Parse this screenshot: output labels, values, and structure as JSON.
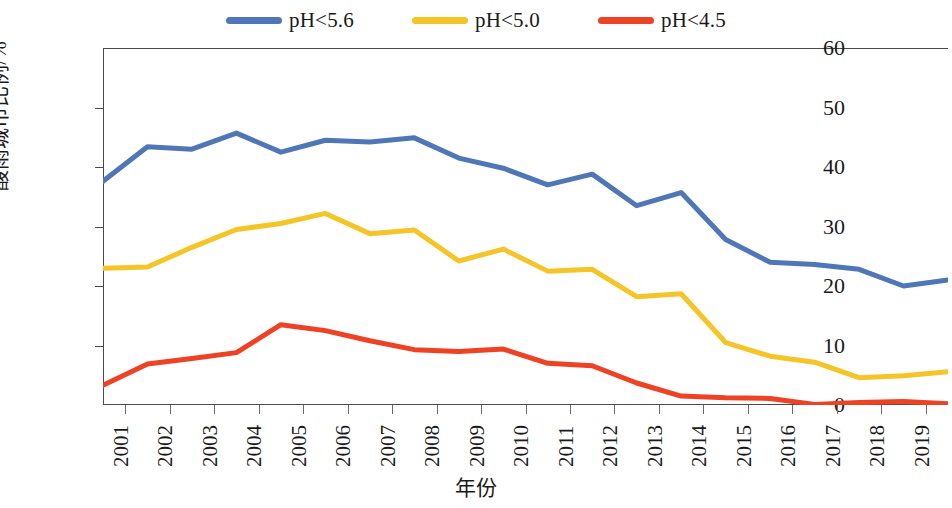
{
  "chart_data": {
    "type": "line",
    "title": "",
    "xlabel": "年份",
    "ylabel": "酸雨城市比例/%",
    "xlim": [
      2001,
      2020
    ],
    "ylim": [
      0,
      60
    ],
    "ytick_labels": [
      "60",
      "50",
      "40",
      "30",
      "20",
      "10",
      "0"
    ],
    "yticks": [
      60,
      50,
      40,
      30,
      20,
      10,
      0
    ],
    "grid": false,
    "legend_position": "top-center",
    "categories": [
      "2001",
      "2002",
      "2003",
      "2004",
      "2005",
      "2006",
      "2007",
      "2008",
      "2009",
      "2010",
      "2011",
      "2012",
      "2013",
      "2014",
      "2015",
      "2016",
      "2017",
      "2018",
      "2019",
      "2020"
    ],
    "series": [
      {
        "name": "pH<5.6",
        "color": "#4f77b8",
        "values": [
          37.6,
          43.4,
          43.0,
          45.7,
          42.5,
          44.5,
          44.2,
          44.9,
          41.5,
          39.8,
          37.0,
          38.8,
          33.5,
          35.7,
          27.8,
          24.0,
          23.6,
          22.8,
          20.0,
          21.0
        ]
      },
      {
        "name": "pH<5.0",
        "color": "#f5c426",
        "values": [
          23.0,
          23.2,
          26.5,
          29.5,
          30.5,
          32.2,
          28.8,
          29.4,
          24.2,
          26.2,
          22.5,
          22.8,
          18.2,
          18.7,
          10.5,
          8.2,
          7.2,
          4.6,
          4.9,
          5.6
        ]
      },
      {
        "name": "pH<4.5",
        "color": "#ef4123",
        "values": [
          3.3,
          6.9,
          7.8,
          8.8,
          13.5,
          12.5,
          10.8,
          9.3,
          9.0,
          9.4,
          7.0,
          6.6,
          3.7,
          1.5,
          1.2,
          1.1,
          0.1,
          0.4,
          0.6,
          0.2
        ]
      }
    ]
  },
  "legend": {
    "entries": [
      {
        "label": "pH<5.6",
        "color": "#4f77b8"
      },
      {
        "label": "pH<5.0",
        "color": "#f5c426"
      },
      {
        "label": "pH<4.5",
        "color": "#ef4123"
      }
    ]
  },
  "axes": {
    "y_title": "酸雨城市比例/%",
    "x_title": "年份"
  }
}
